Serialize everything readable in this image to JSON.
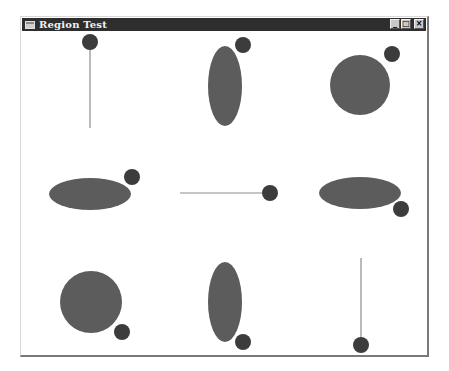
{
  "window": {
    "title": "Region Test",
    "icon": "window-app-icon",
    "buttons": {
      "minimize": "_",
      "maximize": "□",
      "close": "×"
    }
  },
  "colors": {
    "titlebar": "#2e2e2e",
    "shape_fill": "#5c5c5c",
    "dot_fill": "#3c3c3c",
    "line": "#8c8c8c",
    "background": "#ffffff"
  },
  "shapes": [
    {
      "id": "cell-1",
      "kind": "line",
      "x1": 90,
      "y1": 50,
      "x2": 90,
      "y2": 128,
      "dot": {
        "cx": 90,
        "cy": 42,
        "r": 8
      }
    },
    {
      "id": "cell-2",
      "kind": "ellipse",
      "cx": 225,
      "cy": 86,
      "rx": 17,
      "ry": 40,
      "dot": {
        "cx": 243,
        "cy": 45,
        "r": 8
      }
    },
    {
      "id": "cell-3",
      "kind": "circle",
      "cx": 360,
      "cy": 85,
      "r": 30,
      "dot": {
        "cx": 392,
        "cy": 54,
        "r": 8
      }
    },
    {
      "id": "cell-4",
      "kind": "ellipse",
      "cx": 90,
      "cy": 194,
      "rx": 41,
      "ry": 16,
      "dot": {
        "cx": 132,
        "cy": 177,
        "r": 8
      }
    },
    {
      "id": "cell-5",
      "kind": "line",
      "x1": 180,
      "y1": 193,
      "x2": 262,
      "y2": 193,
      "dot": {
        "cx": 270,
        "cy": 193,
        "r": 8
      }
    },
    {
      "id": "cell-6",
      "kind": "ellipse",
      "cx": 360,
      "cy": 193,
      "rx": 41,
      "ry": 16,
      "dot": {
        "cx": 401,
        "cy": 209,
        "r": 8
      }
    },
    {
      "id": "cell-7",
      "kind": "circle",
      "cx": 91,
      "cy": 302,
      "r": 31,
      "dot": {
        "cx": 122,
        "cy": 332,
        "r": 8
      }
    },
    {
      "id": "cell-8",
      "kind": "ellipse",
      "cx": 225,
      "cy": 302,
      "rx": 17,
      "ry": 40,
      "dot": {
        "cx": 243,
        "cy": 342,
        "r": 8
      }
    },
    {
      "id": "cell-9",
      "kind": "line",
      "x1": 361,
      "y1": 258,
      "x2": 361,
      "y2": 337,
      "dot": {
        "cx": 361,
        "cy": 345,
        "r": 8
      }
    }
  ]
}
